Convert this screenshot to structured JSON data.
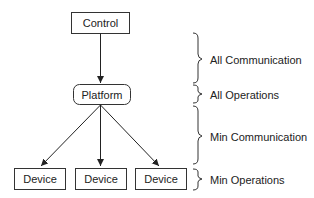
{
  "nodes": {
    "control": "Control",
    "platform": "Platform",
    "devices": [
      "Device",
      "Device",
      "Device"
    ]
  },
  "brackets": [
    {
      "label": "All Communication"
    },
    {
      "label": "All Operations"
    },
    {
      "label": "Min Communication"
    },
    {
      "label": "Min Operations"
    }
  ]
}
